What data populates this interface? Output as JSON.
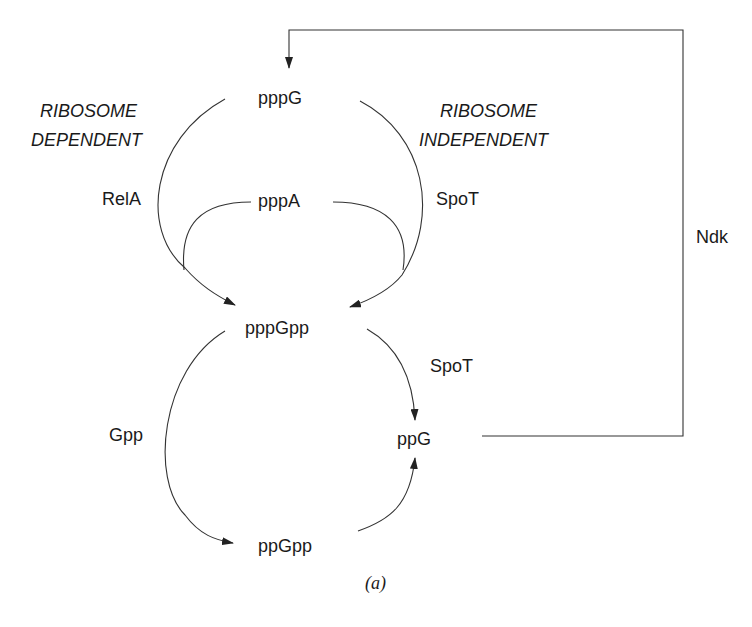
{
  "diagram": {
    "caption": "(a)",
    "nodes": {
      "pppG": "pppG",
      "pppA": "pppA",
      "pppGpp": "pppGpp",
      "ppG": "ppG",
      "ppGpp": "ppGpp"
    },
    "enzymes": {
      "relA": "RelA",
      "spoT_top": "SpoT",
      "spoT_bottom": "SpoT",
      "gpp": "Gpp",
      "ndk": "Ndk"
    },
    "annotations": {
      "ribosome_dependent_line1": "RIBOSOME",
      "ribosome_dependent_line2": "DEPENDENT",
      "ribosome_independent_line1": "RIBOSOME",
      "ribosome_independent_line2": "INDEPENDENT"
    },
    "edges": [
      {
        "from": "pppG",
        "to": "pppGpp",
        "enzyme": "RelA",
        "note": "ribosome dependent"
      },
      {
        "from": "pppA",
        "to": "pppGpp",
        "enzyme": "RelA"
      },
      {
        "from": "pppG",
        "to": "pppGpp",
        "enzyme": "SpoT",
        "note": "ribosome independent"
      },
      {
        "from": "pppA",
        "to": "pppGpp",
        "enzyme": "SpoT"
      },
      {
        "from": "pppGpp",
        "to": "ppGpp",
        "enzyme": "Gpp"
      },
      {
        "from": "pppGpp",
        "to": "ppG",
        "enzyme": "SpoT"
      },
      {
        "from": "ppGpp",
        "to": "ppG"
      },
      {
        "from": "ppG",
        "to": "pppG",
        "enzyme": "Ndk"
      }
    ]
  }
}
